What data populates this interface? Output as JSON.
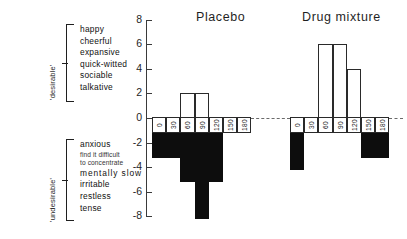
{
  "groups": [
    {
      "name": "'desirable'",
      "terms": [
        {
          "text": "happy",
          "style": "normal"
        },
        {
          "text": "cheerful",
          "style": "normal"
        },
        {
          "text": "expansive",
          "style": "normal"
        },
        {
          "text": "quick-witted",
          "style": "normal"
        },
        {
          "text": "sociable",
          "style": "normal"
        },
        {
          "text": "talkative",
          "style": "normal"
        }
      ]
    },
    {
      "name": "'undesirable'",
      "terms": [
        {
          "text": "anxious",
          "style": "normal"
        },
        {
          "text": "find it difficult",
          "style": "small"
        },
        {
          "text": "to concentrate",
          "style": "small"
        },
        {
          "text": "mentally  slow",
          "style": "wide"
        },
        {
          "text": "irritable",
          "style": "normal"
        },
        {
          "text": "restless",
          "style": "normal"
        },
        {
          "text": "tense",
          "style": "normal"
        }
      ]
    }
  ],
  "axis": {
    "ticks": [
      "8",
      "6",
      "4",
      "2",
      "0",
      "-2",
      "-4",
      "-6",
      "-8"
    ],
    "max": 8,
    "min": -8,
    "step": 2
  },
  "chart_data": {
    "type": "bar",
    "title": "",
    "xlabel": "",
    "ylabel": "",
    "ylim": [
      -8,
      8
    ],
    "grid": false,
    "legend": "none",
    "categories": [
      "0",
      "30",
      "60",
      "90",
      "120",
      "150",
      "180"
    ],
    "panels": [
      {
        "label": "Placebo",
        "values": [
          -2,
          -2,
          -4,
          -7,
          -4,
          0,
          0
        ],
        "positive_values": [
          0,
          0,
          2,
          2,
          0,
          0,
          0
        ]
      },
      {
        "label": "Drug mixture",
        "values": [
          -3,
          0,
          6,
          6,
          4,
          -2,
          -2
        ],
        "positive_values": [
          0,
          0,
          6,
          6,
          4,
          0,
          0
        ]
      }
    ]
  }
}
